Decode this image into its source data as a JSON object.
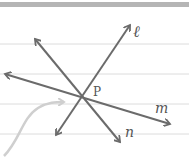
{
  "diagram": {
    "point": {
      "label": "P"
    },
    "lines": [
      {
        "id": "l",
        "label": "ℓ"
      },
      {
        "id": "m",
        "label": "m"
      },
      {
        "id": "n",
        "label": "n"
      }
    ],
    "colors": {
      "ink": "#6b6b6b",
      "paper": "#ffffff",
      "rule": "#dcdcdc",
      "top_bar": "#b5b5b5",
      "pointer": "#cfcfcf"
    }
  }
}
